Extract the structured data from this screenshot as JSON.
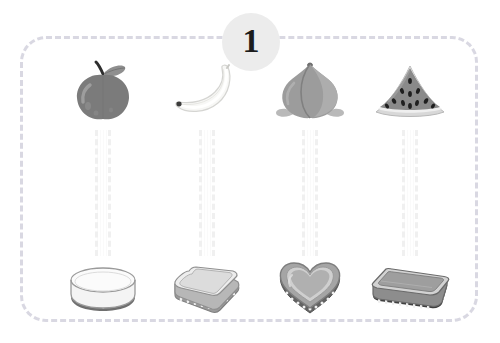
{
  "worksheet": {
    "exercise_number": "1",
    "panel_border_color": "#d9d8e2",
    "badge_bg_color": "#ececec",
    "badge_text_color": "#1c1c1c",
    "connector_color": "#f0f0f0",
    "background_color": "#ffffff"
  },
  "columns": [
    {
      "index": "1",
      "fruit": {
        "name": "apple",
        "label": "Apple",
        "body_color": "#7b7b7b",
        "highlight_color": "#a0a0a0",
        "stem_color": "#2e2e2e",
        "leaf_color": "#8f8f8f"
      },
      "vessel": {
        "name": "round-bowl",
        "label": "Round bowl",
        "body_color": "#f4f4f4",
        "rim_color": "#e2e2e2",
        "base_color": "#6f6f6f",
        "outline_color": "#9a9a9a"
      }
    },
    {
      "index": "2",
      "fruit": {
        "name": "banana",
        "label": "Banana",
        "body_color": "#f7f7f5",
        "highlight_color": "#ffffff",
        "stem_color": "#3b3b3b",
        "leaf_color": "#e6e6e2"
      },
      "vessel": {
        "name": "square-container",
        "label": "Square container",
        "body_color": "#b7b7b7",
        "rim_color": "#ededed",
        "base_color": "#9b9b9b",
        "outline_color": "#8f8f8f"
      }
    },
    {
      "index": "3",
      "fruit": {
        "name": "peach",
        "label": "Peach",
        "body_color": "#9c9c9c",
        "highlight_color": "#b4b4b4",
        "stem_color": "#6f6f6f",
        "leaf_color": "#b9b9b9"
      },
      "vessel": {
        "name": "heart-mold",
        "label": "Heart mold",
        "body_color": "#a5a5a5",
        "rim_color": "#cfcfcf",
        "base_color": "#636363",
        "outline_color": "#7d7d7d"
      }
    },
    {
      "index": "4",
      "fruit": {
        "name": "watermelon-slice",
        "label": "Watermelon slice",
        "body_color": "#8a8a8a",
        "highlight_color": "#a6a6a6",
        "stem_color": "#1f1f1f",
        "leaf_color": "#d8d8d8"
      },
      "vessel": {
        "name": "rectangular-tray",
        "label": "Rectangular tray",
        "body_color": "#8d8d8d",
        "rim_color": "#d2d2d2",
        "base_color": "#3f3f3f",
        "outline_color": "#6a6a6a"
      }
    }
  ]
}
